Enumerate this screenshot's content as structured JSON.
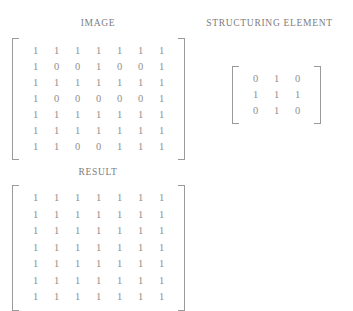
{
  "figure": {
    "background_color": "#ffffff",
    "text_color": "#8c8c8c",
    "bracket_color": "#9a9a9a",
    "clipped_top_text": ""
  },
  "panels": {
    "image": {
      "title": "IMAGE",
      "matrix": {
        "rows": 7,
        "cols": 7,
        "values": [
          [
            "1",
            "1",
            "1",
            "1",
            "1",
            "1",
            "1"
          ],
          [
            "1",
            "0",
            "0",
            "1",
            "0",
            "0",
            "1"
          ],
          [
            "1",
            "1",
            "1",
            "1",
            "1",
            "1",
            "1"
          ],
          [
            "1",
            "0",
            "0",
            "0",
            "0",
            "0",
            "1"
          ],
          [
            "1",
            "1",
            "1",
            "1",
            "1",
            "1",
            "1"
          ],
          [
            "1",
            "1",
            "1",
            "1",
            "1",
            "1",
            "1"
          ],
          [
            "1",
            "1",
            "0",
            "0",
            "1",
            "1",
            "1"
          ]
        ]
      }
    },
    "structuring_element": {
      "title": "STRUCTURING ELEMENT",
      "matrix": {
        "rows": 3,
        "cols": 3,
        "values": [
          [
            "0",
            "1",
            "0"
          ],
          [
            "1",
            "1",
            "1"
          ],
          [
            "0",
            "1",
            "0"
          ]
        ]
      }
    },
    "result": {
      "title": "RESULT",
      "matrix": {
        "rows": 7,
        "cols": 7,
        "values": [
          [
            "1",
            "1",
            "1",
            "1",
            "1",
            "1",
            "1"
          ],
          [
            "1",
            "1",
            "1",
            "1",
            "1",
            "1",
            "1"
          ],
          [
            "1",
            "1",
            "1",
            "1",
            "1",
            "1",
            "1"
          ],
          [
            "1",
            "1",
            "1",
            "1",
            "1",
            "1",
            "1"
          ],
          [
            "1",
            "1",
            "1",
            "1",
            "1",
            "1",
            "1"
          ],
          [
            "1",
            "1",
            "1",
            "1",
            "1",
            "1",
            "1"
          ],
          [
            "1",
            "1",
            "1",
            "1",
            "1",
            "1",
            "1"
          ]
        ]
      }
    }
  }
}
